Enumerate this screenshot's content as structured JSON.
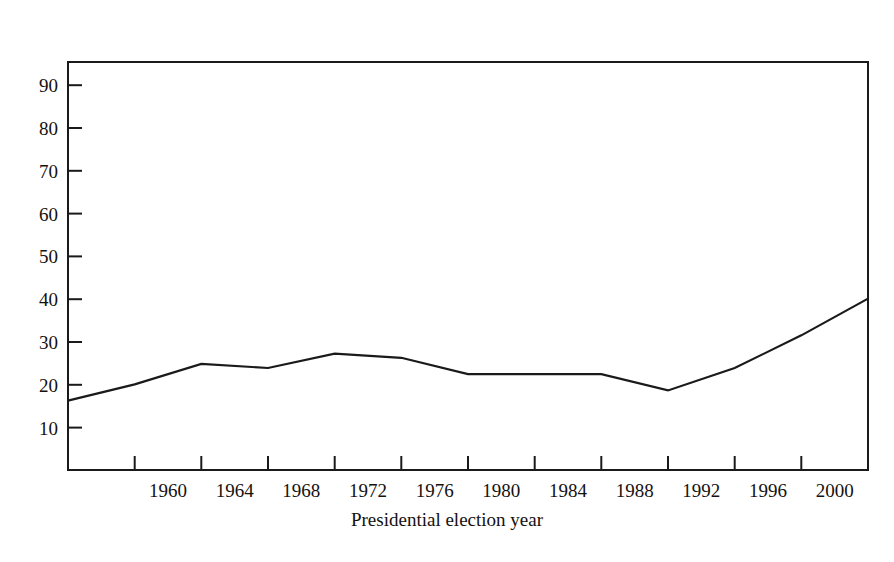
{
  "chart_data": {
    "type": "line",
    "title": "",
    "subtitle": "",
    "xlabel": "Presidential election year",
    "ylabel": "Percent",
    "x": [
      1956,
      1960,
      1964,
      1968,
      1972,
      1976,
      1980,
      1984,
      1988,
      1992,
      1996,
      2000,
      2004
    ],
    "values": [
      17,
      21,
      26,
      25,
      28.5,
      27.5,
      23.5,
      23.5,
      23.5,
      19.5,
      25,
      33,
      42
    ],
    "series": [
      {
        "name": "Percent",
        "values": [
          17,
          21,
          26,
          25,
          28.5,
          27.5,
          23.5,
          23.5,
          23.5,
          19.5,
          25,
          33,
          42
        ]
      }
    ],
    "xlim": [
      1956,
      2004
    ],
    "ylim": [
      0,
      100
    ],
    "xticks": [
      1956,
      1960,
      1964,
      1968,
      1972,
      1976,
      1980,
      1984,
      1988,
      1992,
      1996,
      2000,
      2004
    ],
    "xtick_labels": [
      "",
      "1960",
      "1964",
      "1968",
      "1972",
      "1976",
      "1980",
      "1984",
      "1988",
      "1992",
      "1996",
      "2000",
      ""
    ],
    "yticks": [
      10,
      20,
      30,
      40,
      50,
      60,
      70,
      80,
      90
    ],
    "ytick_labels": [
      "10",
      "20",
      "30",
      "40",
      "50",
      "60",
      "70",
      "80",
      "90"
    ],
    "grid": false,
    "legend": false,
    "legend_position": "none",
    "line_color": "#1a1a1a",
    "frame_color": "#1a1a1a",
    "background_color": "#ffffff",
    "annotations": []
  },
  "figure": {
    "y_axis_caption": "Percent",
    "x_axis_caption": "Presidential election year"
  }
}
